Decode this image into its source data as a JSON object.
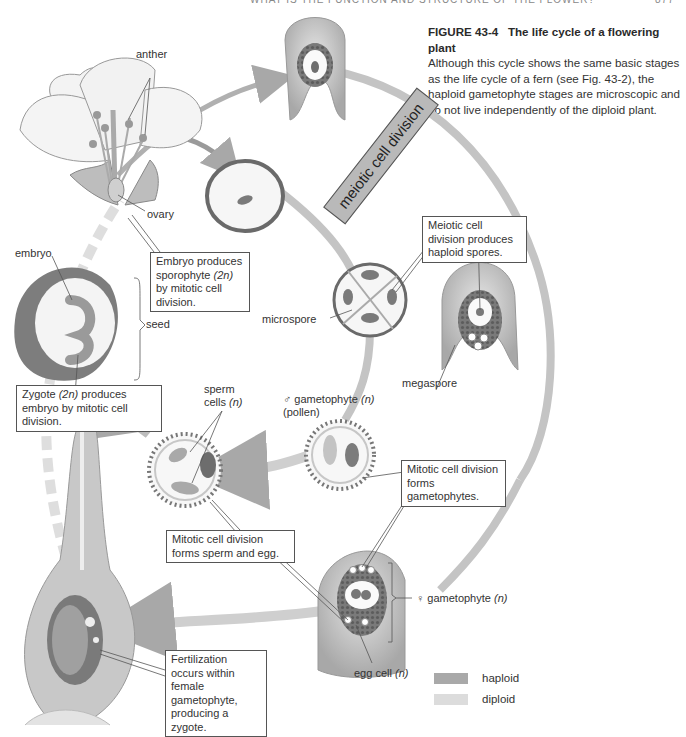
{
  "running_head": {
    "text": "WHAT IS THE FUNCTION AND STRUCTURE OF THE FLOWER?",
    "page": "877"
  },
  "caption": {
    "figure_label": "FIGURE 43-4",
    "title": "The life cycle of a flowering plant",
    "body": "Although this cycle shows the same basic stages as the life cycle of a fern (see Fig. 43-2), the haploid gametophyte stages are microscopic and do not live independently of the diploid plant."
  },
  "labels": {
    "anther": "anther",
    "ovary": "ovary",
    "embryo": "embryo",
    "seed": "seed",
    "microspore": "microspore",
    "megaspore": "megaspore",
    "sperm_cells_line1": "sperm",
    "sperm_cells_line2": "cells",
    "sperm_cells_n": "(n)",
    "male_gametophyte_symbol": "♂",
    "male_gametophyte": "gametophyte",
    "male_gametophyte_n": "(n)",
    "pollen": "(pollen)",
    "female_gametophyte_symbol": "♀",
    "female_gametophyte": "gametophyte",
    "female_gametophyte_n": "(n)",
    "egg_cell": "egg cell",
    "egg_cell_n": "(n)",
    "meiotic_banner": "meiotic cell division"
  },
  "callouts": {
    "embryo_sporophyte": {
      "pre": "Embryo produces sporophyte ",
      "em": "(2n)",
      "post": " by mitotic cell division."
    },
    "zygote_embryo": {
      "pre": "Zygote ",
      "em": "(2n)",
      "post": " produces embryo by mitotic cell division."
    },
    "meiotic_spores": "Meiotic cell division produces haploid spores.",
    "mitotic_gametophytes": "Mitotic cell division forms gametophytes.",
    "mitotic_sperm_egg": "Mitotic cell division forms sperm and egg.",
    "fertilization": "Fertilization occurs within female gametophyte, producing a zygote."
  },
  "legend": [
    {
      "label": "haploid",
      "color": "#a9a9a9"
    },
    {
      "label": "diploid",
      "color": "#dcdcdc"
    }
  ],
  "colors": {
    "haploid": "#a9a9a9",
    "diploid": "#dcdcdc",
    "outline": "#555555"
  }
}
